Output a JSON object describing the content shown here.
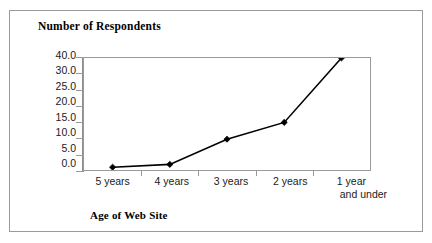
{
  "figure": {
    "border_color": "#9a9a9a",
    "background": "#ffffff"
  },
  "chart_data": {
    "type": "line",
    "title": "Number of Respondents",
    "xlabel": "Age of Web Site",
    "ylabel": "",
    "categories": [
      "5 years",
      "4 years",
      "3 years",
      "2 years",
      "1 year and under"
    ],
    "category_lines": [
      [
        "5 years"
      ],
      [
        "4 years"
      ],
      [
        "3 years"
      ],
      [
        "2 years"
      ],
      [
        "1 year",
        "and under"
      ]
    ],
    "values": [
      1,
      2,
      11,
      17,
      40
    ],
    "ytick_labels": [
      "40.0",
      "30.0",
      "25.0",
      "20.0",
      "15.0",
      "10.0",
      "5.0",
      "0.0"
    ],
    "ytick_values": [
      40.0,
      30.0,
      25.0,
      20.0,
      15.0,
      10.0,
      5.0,
      0.0
    ],
    "ylim": [
      0,
      40
    ],
    "grid": false,
    "legend": false,
    "marker": "diamond",
    "line_color": "#000000",
    "marker_color": "#000000",
    "axis_color": "#9a9a9a"
  }
}
